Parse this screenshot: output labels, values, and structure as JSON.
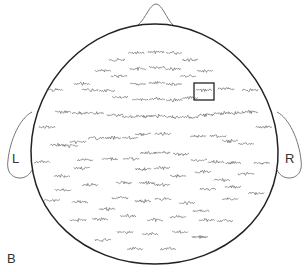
{
  "figure": {
    "panel_label": "B",
    "left_ear_label": "L",
    "right_ear_label": "R",
    "colors": {
      "outline": "#222222",
      "ear_outline": "#777777",
      "trace": "#555555",
      "selection_box": "#111111",
      "background": "#ffffff"
    },
    "selection_box": {
      "x": 194,
      "y": 83,
      "w": 20,
      "h": 17
    },
    "electrodes": [
      [
        136,
        53
      ],
      [
        156,
        52
      ],
      [
        174,
        53
      ],
      [
        117,
        60
      ],
      [
        190,
        60
      ],
      [
        103,
        71
      ],
      [
        138,
        69
      ],
      [
        157,
        67
      ],
      [
        173,
        69
      ],
      [
        205,
        71
      ],
      [
        82,
        84
      ],
      [
        119,
        76
      ],
      [
        188,
        76
      ],
      [
        55,
        90
      ],
      [
        90,
        90
      ],
      [
        107,
        91
      ],
      [
        138,
        84
      ],
      [
        157,
        83
      ],
      [
        174,
        84
      ],
      [
        204,
        90
      ],
      [
        226,
        89
      ],
      [
        250,
        90
      ],
      [
        120,
        97
      ],
      [
        140,
        100
      ],
      [
        157,
        99
      ],
      [
        174,
        100
      ],
      [
        190,
        98
      ],
      [
        63,
        112
      ],
      [
        80,
        113
      ],
      [
        96,
        113
      ],
      [
        115,
        115
      ],
      [
        130,
        117
      ],
      [
        144,
        116
      ],
      [
        158,
        116
      ],
      [
        174,
        117
      ],
      [
        190,
        117
      ],
      [
        206,
        115
      ],
      [
        222,
        113
      ],
      [
        236,
        113
      ],
      [
        250,
        112
      ],
      [
        47,
        127
      ],
      [
        264,
        127
      ],
      [
        70,
        146
      ],
      [
        143,
        134
      ],
      [
        163,
        134
      ],
      [
        198,
        136
      ],
      [
        218,
        136
      ],
      [
        58,
        145
      ],
      [
        78,
        142
      ],
      [
        96,
        138
      ],
      [
        113,
        138
      ],
      [
        130,
        138
      ],
      [
        230,
        141
      ],
      [
        246,
        144
      ],
      [
        42,
        162
      ],
      [
        85,
        160
      ],
      [
        110,
        159
      ],
      [
        131,
        159
      ],
      [
        148,
        153
      ],
      [
        162,
        153
      ],
      [
        181,
        154
      ],
      [
        199,
        160
      ],
      [
        216,
        162
      ],
      [
        233,
        163
      ],
      [
        262,
        163
      ],
      [
        62,
        176
      ],
      [
        82,
        168
      ],
      [
        143,
        169
      ],
      [
        162,
        168
      ],
      [
        178,
        176
      ],
      [
        203,
        172
      ],
      [
        222,
        180
      ],
      [
        246,
        174
      ],
      [
        63,
        190
      ],
      [
        90,
        185
      ],
      [
        124,
        183
      ],
      [
        147,
        183
      ],
      [
        162,
        185
      ],
      [
        208,
        189
      ],
      [
        233,
        187
      ],
      [
        52,
        200
      ],
      [
        80,
        202
      ],
      [
        120,
        198
      ],
      [
        143,
        201
      ],
      [
        163,
        199
      ],
      [
        187,
        203
      ],
      [
        230,
        199
      ],
      [
        256,
        193
      ],
      [
        107,
        209
      ],
      [
        201,
        211
      ],
      [
        78,
        220
      ],
      [
        100,
        219
      ],
      [
        128,
        216
      ],
      [
        155,
        220
      ],
      [
        178,
        217
      ],
      [
        207,
        220
      ],
      [
        225,
        221
      ],
      [
        125,
        232
      ],
      [
        150,
        234
      ],
      [
        180,
        232
      ],
      [
        200,
        237
      ],
      [
        103,
        240
      ],
      [
        135,
        249
      ],
      [
        168,
        249
      ]
    ]
  }
}
